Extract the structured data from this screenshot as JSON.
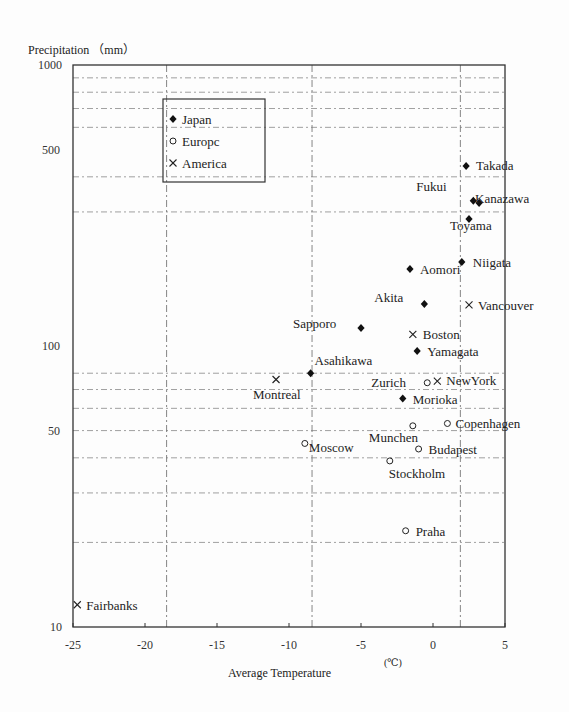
{
  "chart_data": {
    "type": "scatter",
    "title": "",
    "xlabel": "Average Temperature",
    "xunit": "(℃)",
    "ylabel": "Precipitation （mm）",
    "xlim": [
      -25,
      5
    ],
    "ylim": [
      10,
      1000
    ],
    "yscale": "log",
    "x_ticks": [
      -25,
      -20,
      -15,
      -10,
      -5,
      0,
      5
    ],
    "y_ticks": [
      10,
      50,
      100,
      500,
      1000
    ],
    "grid": true,
    "x_gridlines": [
      -18.5,
      -8.4,
      1.9
    ],
    "y_gridlines": [
      20,
      30,
      40,
      50,
      60,
      70,
      80,
      300,
      400,
      600,
      700,
      800,
      900
    ],
    "legend": {
      "position": "upper-left",
      "entries": [
        {
          "name": "Japan",
          "marker": "diamond-filled"
        },
        {
          "name": "Europc",
          "marker": "circle-open"
        },
        {
          "name": "America",
          "marker": "x"
        }
      ]
    },
    "series": [
      {
        "name": "Japan",
        "marker": "diamond-filled",
        "points": [
          {
            "label": "Takada",
            "x": 2.3,
            "y": 437,
            "lx": 10,
            "ly": 4
          },
          {
            "label": "Kanazawa",
            "x": 3.2,
            "y": 323,
            "lx": -4,
            "ly": 0
          },
          {
            "label": "Fukui",
            "x": 2.8,
            "y": 329,
            "lx": -57,
            "ly": -10
          },
          {
            "label": "Toyama",
            "x": 2.5,
            "y": 283,
            "lx": -19,
            "ly": 11
          },
          {
            "label": "Niigata",
            "x": 2.0,
            "y": 199,
            "lx": 11,
            "ly": 5
          },
          {
            "label": "Aomori",
            "x": -1.6,
            "y": 188,
            "lx": 10,
            "ly": 5
          },
          {
            "label": "Akita",
            "x": -0.6,
            "y": 141,
            "lx": -50,
            "ly": -2
          },
          {
            "label": "Sapporo",
            "x": -5.0,
            "y": 116,
            "lx": -68,
            "ly": 0
          },
          {
            "label": "Asahikawa",
            "x": -8.5,
            "y": 80,
            "lx": 4,
            "ly": -8
          },
          {
            "label": "Yamagata",
            "x": -1.1,
            "y": 96,
            "lx": 10,
            "ly": 5
          },
          {
            "label": "Morioka",
            "x": -2.1,
            "y": 65,
            "lx": 10,
            "ly": 5
          }
        ]
      },
      {
        "name": "Europc",
        "marker": "circle-open",
        "points": [
          {
            "label": "Zurich",
            "x": -0.4,
            "y": 74,
            "lx": -56,
            "ly": 4
          },
          {
            "label": "Copenhagen",
            "x": 1.0,
            "y": 53,
            "lx": 8,
            "ly": 5
          },
          {
            "label": "Munchen",
            "x": -1.4,
            "y": 52,
            "lx": -44,
            "ly": 16
          },
          {
            "label": "Moscow",
            "x": -8.9,
            "y": 45,
            "lx": 4,
            "ly": 9
          },
          {
            "label": "Budapest",
            "x": -1.0,
            "y": 43,
            "lx": 10,
            "ly": 5
          },
          {
            "label": "Stockholm",
            "x": -3.0,
            "y": 39,
            "lx": -1,
            "ly": 17
          },
          {
            "label": "Praha",
            "x": -1.9,
            "y": 22,
            "lx": 10,
            "ly": 5
          }
        ]
      },
      {
        "name": "America",
        "marker": "x",
        "points": [
          {
            "label": "Boston",
            "x": -1.4,
            "y": 110,
            "lx": 10,
            "ly": 5
          },
          {
            "label": "Vancouver",
            "x": 2.5,
            "y": 140,
            "lx": 9,
            "ly": 5
          },
          {
            "label": "NewYork",
            "x": 0.3,
            "y": 75,
            "lx": 9,
            "ly": 4
          },
          {
            "label": "Montreal",
            "x": -10.9,
            "y": 76,
            "lx": -23,
            "ly": 20
          },
          {
            "label": "Fairbanks",
            "x": -24.7,
            "y": 12,
            "lx": 9,
            "ly": 5
          }
        ]
      }
    ]
  }
}
